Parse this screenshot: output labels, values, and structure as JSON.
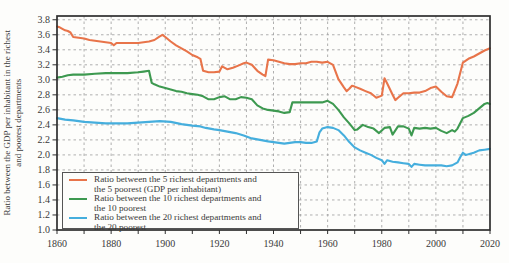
{
  "figure": {
    "ylabel_line1": "Ratio between the GDP per inhabitant in the richest",
    "ylabel_line2": "and poorest departments"
  },
  "legend": {
    "items": [
      {
        "color": "#e8744a",
        "line1": "Ratio between the 5 richest departments and",
        "line2": "the 5 poorest (GDP per inhabitant)"
      },
      {
        "color": "#3d9950",
        "line1": "Ratio between the 10 richest departments and",
        "line2": "the 10 poorest"
      },
      {
        "color": "#45aedd",
        "line1": "Ratio between the 20 richest departments and",
        "line2": "the 20 poorest"
      }
    ]
  },
  "chart_data": {
    "type": "line",
    "title": "",
    "xlabel": "",
    "ylabel": "Ratio between the GDP per inhabitant in the richest and poorest departments",
    "xlim": [
      1860,
      2020
    ],
    "ylim": [
      1.0,
      3.85
    ],
    "xticks_labeled": [
      1860,
      1880,
      1900,
      1920,
      1940,
      1960,
      1980,
      2000,
      2020
    ],
    "xtick_minor_interval": 10,
    "yticks": [
      1.0,
      1.2,
      1.4,
      1.6,
      1.8,
      2.0,
      2.2,
      2.4,
      2.6,
      2.8,
      3.0,
      3.2,
      3.4,
      3.6,
      3.8
    ],
    "grid": "dashed gray, every 0.2 vertical-value and every 10 years horizontal",
    "legend_position": "lower-left",
    "axis_color": "#2e2e2e",
    "grid_color": "#a6a6a6",
    "text_color": "#3a3a3a",
    "series": [
      {
        "name": "Ratio between the 5 richest departments and the 5 poorest (GDP per inhabitant)",
        "color": "#e8744a",
        "points": [
          [
            1860,
            3.71
          ],
          [
            1861,
            3.7
          ],
          [
            1862,
            3.68
          ],
          [
            1863,
            3.66
          ],
          [
            1864,
            3.65
          ],
          [
            1865,
            3.63
          ],
          [
            1866,
            3.57
          ],
          [
            1868,
            3.56
          ],
          [
            1870,
            3.55
          ],
          [
            1872,
            3.53
          ],
          [
            1874,
            3.52
          ],
          [
            1876,
            3.51
          ],
          [
            1878,
            3.5
          ],
          [
            1880,
            3.49
          ],
          [
            1881,
            3.46
          ],
          [
            1882,
            3.49
          ],
          [
            1885,
            3.49
          ],
          [
            1888,
            3.49
          ],
          [
            1890,
            3.49
          ],
          [
            1892,
            3.5
          ],
          [
            1894,
            3.51
          ],
          [
            1896,
            3.53
          ],
          [
            1898,
            3.58
          ],
          [
            1899,
            3.6
          ],
          [
            1900,
            3.57
          ],
          [
            1902,
            3.51
          ],
          [
            1904,
            3.46
          ],
          [
            1906,
            3.42
          ],
          [
            1908,
            3.38
          ],
          [
            1910,
            3.33
          ],
          [
            1912,
            3.3
          ],
          [
            1913,
            3.28
          ],
          [
            1914,
            3.12
          ],
          [
            1916,
            3.1
          ],
          [
            1918,
            3.1
          ],
          [
            1920,
            3.11
          ],
          [
            1921,
            3.18
          ],
          [
            1922,
            3.16
          ],
          [
            1923,
            3.14
          ],
          [
            1925,
            3.16
          ],
          [
            1927,
            3.19
          ],
          [
            1929,
            3.22
          ],
          [
            1930,
            3.23
          ],
          [
            1932,
            3.2
          ],
          [
            1934,
            3.12
          ],
          [
            1936,
            3.07
          ],
          [
            1937,
            3.05
          ],
          [
            1938,
            3.27
          ],
          [
            1940,
            3.26
          ],
          [
            1942,
            3.24
          ],
          [
            1944,
            3.22
          ],
          [
            1946,
            3.21
          ],
          [
            1948,
            3.21
          ],
          [
            1950,
            3.22
          ],
          [
            1952,
            3.22
          ],
          [
            1954,
            3.24
          ],
          [
            1956,
            3.24
          ],
          [
            1958,
            3.23
          ],
          [
            1960,
            3.24
          ],
          [
            1962,
            3.2
          ],
          [
            1964,
            3.01
          ],
          [
            1966,
            2.9
          ],
          [
            1967,
            2.85
          ],
          [
            1968,
            2.88
          ],
          [
            1969,
            2.92
          ],
          [
            1970,
            2.91
          ],
          [
            1972,
            2.88
          ],
          [
            1974,
            2.85
          ],
          [
            1976,
            2.82
          ],
          [
            1978,
            2.76
          ],
          [
            1980,
            2.79
          ],
          [
            1981,
            3.02
          ],
          [
            1982,
            2.95
          ],
          [
            1984,
            2.8
          ],
          [
            1985,
            2.73
          ],
          [
            1986,
            2.76
          ],
          [
            1988,
            2.82
          ],
          [
            1990,
            2.82
          ],
          [
            1992,
            2.83
          ],
          [
            1994,
            2.83
          ],
          [
            1996,
            2.85
          ],
          [
            1998,
            2.89
          ],
          [
            2000,
            2.91
          ],
          [
            2002,
            2.84
          ],
          [
            2004,
            2.78
          ],
          [
            2006,
            2.77
          ],
          [
            2008,
            2.95
          ],
          [
            2010,
            3.23
          ],
          [
            2012,
            3.28
          ],
          [
            2014,
            3.31
          ],
          [
            2016,
            3.35
          ],
          [
            2018,
            3.39
          ],
          [
            2020,
            3.42
          ]
        ]
      },
      {
        "name": "Ratio between the 10 richest departments and the 10 poorest",
        "color": "#3d9950",
        "points": [
          [
            1860,
            3.03
          ],
          [
            1862,
            3.04
          ],
          [
            1864,
            3.06
          ],
          [
            1866,
            3.07
          ],
          [
            1870,
            3.07
          ],
          [
            1874,
            3.08
          ],
          [
            1878,
            3.09
          ],
          [
            1882,
            3.09
          ],
          [
            1886,
            3.09
          ],
          [
            1890,
            3.1
          ],
          [
            1892,
            3.11
          ],
          [
            1894,
            3.12
          ],
          [
            1895,
            2.96
          ],
          [
            1896,
            2.94
          ],
          [
            1898,
            2.91
          ],
          [
            1900,
            2.89
          ],
          [
            1902,
            2.87
          ],
          [
            1904,
            2.85
          ],
          [
            1906,
            2.84
          ],
          [
            1908,
            2.82
          ],
          [
            1910,
            2.81
          ],
          [
            1912,
            2.8
          ],
          [
            1914,
            2.78
          ],
          [
            1916,
            2.74
          ],
          [
            1918,
            2.74
          ],
          [
            1920,
            2.77
          ],
          [
            1922,
            2.78
          ],
          [
            1924,
            2.74
          ],
          [
            1926,
            2.74
          ],
          [
            1928,
            2.77
          ],
          [
            1930,
            2.76
          ],
          [
            1932,
            2.74
          ],
          [
            1934,
            2.66
          ],
          [
            1936,
            2.62
          ],
          [
            1938,
            2.6
          ],
          [
            1940,
            2.59
          ],
          [
            1942,
            2.58
          ],
          [
            1944,
            2.56
          ],
          [
            1946,
            2.57
          ],
          [
            1947,
            2.7
          ],
          [
            1950,
            2.7
          ],
          [
            1954,
            2.7
          ],
          [
            1958,
            2.7
          ],
          [
            1960,
            2.72
          ],
          [
            1962,
            2.68
          ],
          [
            1964,
            2.6
          ],
          [
            1966,
            2.5
          ],
          [
            1968,
            2.42
          ],
          [
            1970,
            2.33
          ],
          [
            1971,
            2.34
          ],
          [
            1973,
            2.4
          ],
          [
            1975,
            2.37
          ],
          [
            1977,
            2.35
          ],
          [
            1979,
            2.29
          ],
          [
            1981,
            2.36
          ],
          [
            1983,
            2.37
          ],
          [
            1984,
            2.27
          ],
          [
            1986,
            2.38
          ],
          [
            1988,
            2.38
          ],
          [
            1990,
            2.35
          ],
          [
            1991,
            2.26
          ],
          [
            1992,
            2.36
          ],
          [
            1994,
            2.35
          ],
          [
            1996,
            2.36
          ],
          [
            1998,
            2.35
          ],
          [
            2000,
            2.36
          ],
          [
            2002,
            2.32
          ],
          [
            2004,
            2.29
          ],
          [
            2006,
            2.33
          ],
          [
            2007,
            2.31
          ],
          [
            2008,
            2.35
          ],
          [
            2010,
            2.49
          ],
          [
            2012,
            2.52
          ],
          [
            2014,
            2.56
          ],
          [
            2016,
            2.62
          ],
          [
            2018,
            2.68
          ],
          [
            2019,
            2.69
          ],
          [
            2020,
            2.68
          ]
        ]
      },
      {
        "name": "Ratio between the 20 richest departments and the 20 poorest",
        "color": "#45aedd",
        "points": [
          [
            1860,
            2.49
          ],
          [
            1863,
            2.47
          ],
          [
            1866,
            2.46
          ],
          [
            1870,
            2.44
          ],
          [
            1874,
            2.43
          ],
          [
            1878,
            2.42
          ],
          [
            1882,
            2.42
          ],
          [
            1886,
            2.42
          ],
          [
            1890,
            2.43
          ],
          [
            1894,
            2.44
          ],
          [
            1898,
            2.45
          ],
          [
            1902,
            2.44
          ],
          [
            1906,
            2.41
          ],
          [
            1910,
            2.39
          ],
          [
            1913,
            2.38
          ],
          [
            1915,
            2.36
          ],
          [
            1918,
            2.34
          ],
          [
            1920,
            2.33
          ],
          [
            1923,
            2.31
          ],
          [
            1926,
            2.29
          ],
          [
            1929,
            2.26
          ],
          [
            1932,
            2.22
          ],
          [
            1935,
            2.2
          ],
          [
            1938,
            2.18
          ],
          [
            1940,
            2.17
          ],
          [
            1942,
            2.16
          ],
          [
            1944,
            2.15
          ],
          [
            1946,
            2.16
          ],
          [
            1948,
            2.17
          ],
          [
            1950,
            2.17
          ],
          [
            1952,
            2.16
          ],
          [
            1954,
            2.16
          ],
          [
            1956,
            2.18
          ],
          [
            1957,
            2.3
          ],
          [
            1958,
            2.35
          ],
          [
            1960,
            2.37
          ],
          [
            1962,
            2.36
          ],
          [
            1964,
            2.33
          ],
          [
            1966,
            2.26
          ],
          [
            1968,
            2.17
          ],
          [
            1970,
            2.1
          ],
          [
            1972,
            2.06
          ],
          [
            1974,
            2.03
          ],
          [
            1976,
            2.0
          ],
          [
            1978,
            1.96
          ],
          [
            1980,
            1.93
          ],
          [
            1981,
            1.88
          ],
          [
            1982,
            1.93
          ],
          [
            1984,
            1.91
          ],
          [
            1986,
            1.9
          ],
          [
            1988,
            1.89
          ],
          [
            1990,
            1.88
          ],
          [
            1991,
            1.84
          ],
          [
            1992,
            1.88
          ],
          [
            1994,
            1.87
          ],
          [
            1996,
            1.86
          ],
          [
            1998,
            1.86
          ],
          [
            2000,
            1.86
          ],
          [
            2002,
            1.86
          ],
          [
            2004,
            1.85
          ],
          [
            2006,
            1.86
          ],
          [
            2008,
            1.9
          ],
          [
            2009,
            1.97
          ],
          [
            2010,
            2.03
          ],
          [
            2011,
            2.0
          ],
          [
            2012,
            2.01
          ],
          [
            2014,
            2.03
          ],
          [
            2016,
            2.06
          ],
          [
            2018,
            2.07
          ],
          [
            2020,
            2.08
          ]
        ]
      }
    ]
  }
}
